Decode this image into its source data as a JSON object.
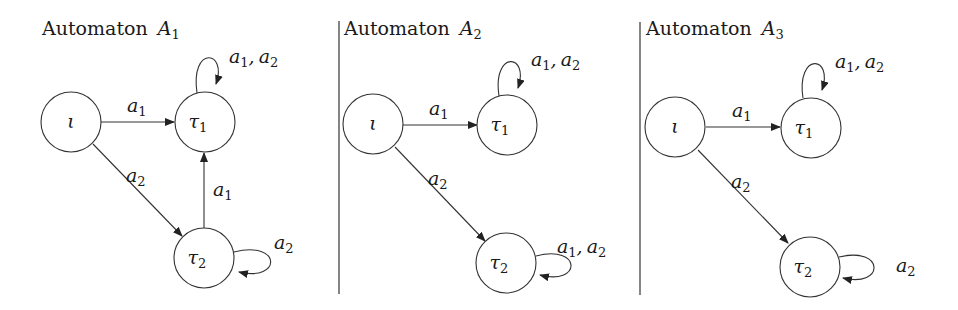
{
  "automata": [
    {
      "title": "Automaton",
      "title_var": "A",
      "title_sub": "1",
      "states": [
        {
          "id": "iota",
          "label": "ι",
          "sub": ""
        },
        {
          "id": "tau1",
          "label": "τ",
          "sub": "1"
        },
        {
          "id": "tau2",
          "label": "τ",
          "sub": "2"
        }
      ],
      "transitions": [
        {
          "from": "iota",
          "to": "tau1",
          "label": "a",
          "sub": "1"
        },
        {
          "from": "iota",
          "to": "tau2",
          "label": "a",
          "sub": "2"
        },
        {
          "from": "tau2",
          "to": "tau1",
          "label": "a",
          "sub": "1"
        },
        {
          "from": "tau1",
          "to": "tau1",
          "label": "a1, a2"
        },
        {
          "from": "tau2",
          "to": "tau2",
          "label": "a2"
        }
      ]
    },
    {
      "title": "Automaton",
      "title_var": "A",
      "title_sub": "2",
      "states": [
        {
          "id": "iota",
          "label": "ι",
          "sub": ""
        },
        {
          "id": "tau1",
          "label": "τ",
          "sub": "1"
        },
        {
          "id": "tau2",
          "label": "τ",
          "sub": "2"
        }
      ],
      "transitions": [
        {
          "from": "iota",
          "to": "tau1",
          "label": "a",
          "sub": "1"
        },
        {
          "from": "iota",
          "to": "tau2",
          "label": "a",
          "sub": "2"
        },
        {
          "from": "tau1",
          "to": "tau1",
          "label": "a1, a2"
        },
        {
          "from": "tau2",
          "to": "tau2",
          "label": "a1, a2"
        }
      ]
    },
    {
      "title": "Automaton",
      "title_var": "A",
      "title_sub": "3",
      "states": [
        {
          "id": "iota",
          "label": "ι",
          "sub": ""
        },
        {
          "id": "tau1",
          "label": "τ",
          "sub": "1"
        },
        {
          "id": "tau2",
          "label": "τ",
          "sub": "2"
        }
      ],
      "transitions": [
        {
          "from": "iota",
          "to": "tau1",
          "label": "a",
          "sub": "1"
        },
        {
          "from": "iota",
          "to": "tau2",
          "label": "a",
          "sub": "2"
        },
        {
          "from": "tau1",
          "to": "tau1",
          "label": "a1, a2"
        },
        {
          "from": "tau2",
          "to": "tau2",
          "label": "a2"
        }
      ]
    }
  ],
  "symbols": {
    "a": "a",
    "comma": ",",
    "one": "1",
    "two": "2",
    "iota": "ι",
    "tau": "τ"
  }
}
